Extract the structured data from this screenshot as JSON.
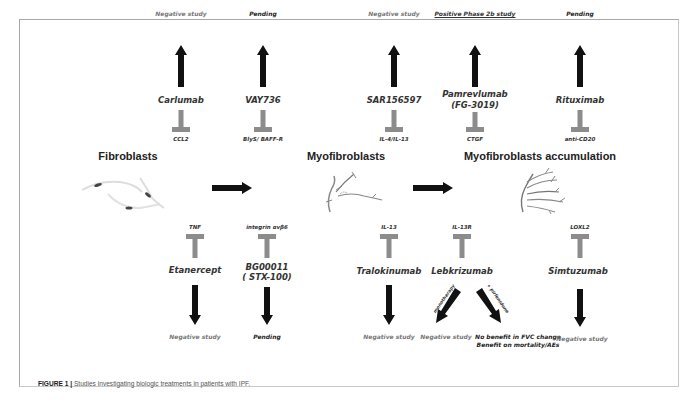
{
  "figure": {
    "caption_label": "FIGURE 1 |",
    "caption_text": " Studies investigating biologic treatments in patients with IPF."
  },
  "stages": [
    {
      "title": "Fibroblasts"
    },
    {
      "title": "Myofibroblasts"
    },
    {
      "title": "Myofibroblasts accumulation"
    }
  ],
  "top_row": [
    {
      "drug": "Carlumab",
      "target": "CCL2",
      "outcome": "Negative study",
      "outcome_type": "negative"
    },
    {
      "drug": "VAY736",
      "target": "BlyS/ BAFF-R",
      "outcome": "Pending",
      "outcome_type": "pending"
    },
    {
      "drug": "SAR156597",
      "target": "IL-4/IL-13",
      "outcome": "Negative study",
      "outcome_type": "negative"
    },
    {
      "drug": "Pamrevlumab",
      "drug_line2": "(FG-3019)",
      "target": "CTGF",
      "outcome": "Positive Phase 2b study",
      "outcome_type": "positive"
    },
    {
      "drug": "Rituximab",
      "target": "anti-CD20",
      "outcome": "Pending",
      "outcome_type": "pending"
    }
  ],
  "bottom_row": [
    {
      "drug": "Etanercept",
      "target": "TNF",
      "outcome": "Negative study",
      "outcome_type": "negative"
    },
    {
      "drug": "BG00011",
      "drug_line2": "( STX-100)",
      "target": "integrin αvβ6",
      "outcome": "Pending",
      "outcome_type": "pending"
    },
    {
      "drug": "Tralokinumab",
      "target": "IL-13",
      "outcome": "Negative study",
      "outcome_type": "negative"
    },
    {
      "drug": "Lebkrizumab",
      "target": "IL-13R",
      "branches": [
        {
          "label": "monotherapy",
          "outcome": "Negative study",
          "outcome_type": "negative"
        },
        {
          "label": "+ pirfenidone",
          "outcome_line1": "No benefit in FVC change",
          "outcome_line2": "Benefit on mortality/AEs",
          "outcome_type": "mixed"
        }
      ]
    },
    {
      "drug": "Simtuzumab",
      "target": "LOXL2",
      "outcome": "Negative study",
      "outcome_type": "negative"
    }
  ],
  "colors": {
    "arrow": "#111111",
    "inhibitor": "#8c8c8c",
    "frame": "#a8a8a8"
  }
}
